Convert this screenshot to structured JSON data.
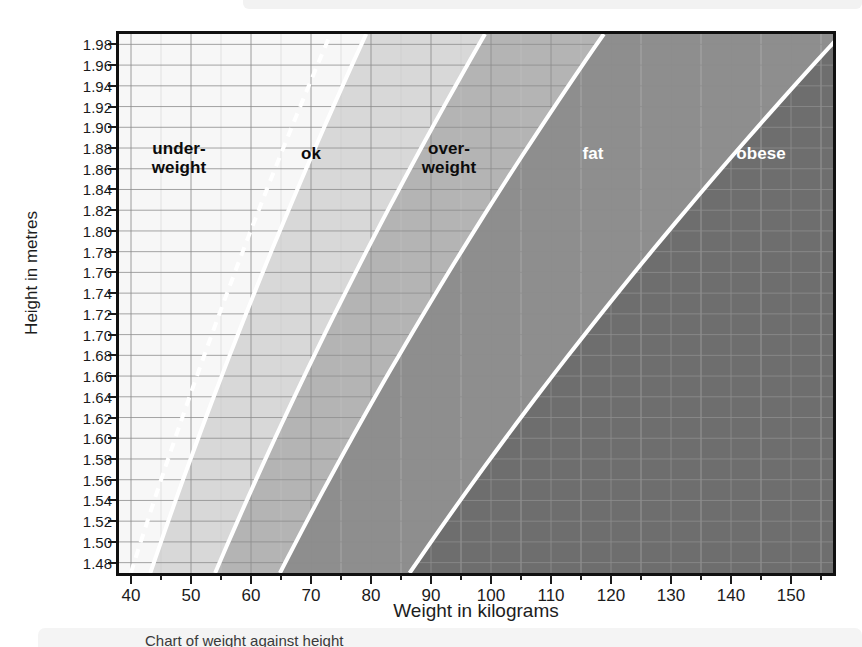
{
  "figure": {
    "y_axis_title": "Height in metres",
    "x_axis_title": "Weight in kilograms",
    "caption": "Chart of weight against height"
  },
  "chart_data": {
    "type": "area",
    "title": "",
    "subtitle": "",
    "xlabel": "Weight in kilograms",
    "ylabel": "Height in metres",
    "xlim": [
      38,
      157
    ],
    "ylim": [
      1.47,
      1.99
    ],
    "grid": true,
    "legend_position": "inline-labels",
    "x_major_ticks": [
      40,
      50,
      60,
      70,
      80,
      90,
      100,
      110,
      120,
      130,
      140,
      150
    ],
    "x_minor_step": 5,
    "y_ticks": [
      1.98,
      1.96,
      1.94,
      1.92,
      1.9,
      1.88,
      1.86,
      1.84,
      1.82,
      1.8,
      1.78,
      1.76,
      1.74,
      1.72,
      1.7,
      1.68,
      1.66,
      1.64,
      1.62,
      1.6,
      1.58,
      1.56,
      1.54,
      1.52,
      1.5,
      1.48
    ],
    "y_tick_labels": [
      "1.98",
      "1.96",
      "1.94",
      "1.92",
      "1.90",
      "1.88",
      "1.86",
      "1.84",
      "1.82",
      "1.80",
      "1.78",
      "1.76",
      "1.74",
      "1.72",
      "1.70",
      "1.68",
      "1.66",
      "1.64",
      "1.62",
      "1.60",
      "1.58",
      "1.56",
      "1.54",
      "1.52",
      "1.50",
      "1.48"
    ],
    "boundary_bmi": [
      18.5,
      20,
      25,
      30,
      40
    ],
    "bands": [
      {
        "name": "underweight",
        "label": "under-\nweight",
        "bmi_min": 0,
        "bmi_max": 20,
        "fill": "#f7f7f7",
        "label_color": "#0c0c0c",
        "label_x_kg": 48,
        "label_y_m": 1.87
      },
      {
        "name": "ok",
        "label": "ok",
        "bmi_min": 20,
        "bmi_max": 25,
        "fill": "#d8d8d8",
        "label_color": "#0c0c0c",
        "label_x_kg": 70,
        "label_y_m": 1.875
      },
      {
        "name": "overweight",
        "label": "over-\nweight",
        "bmi_min": 25,
        "bmi_max": 30,
        "fill": "#b4b4b4",
        "label_color": "#0c0c0c",
        "label_x_kg": 93,
        "label_y_m": 1.87
      },
      {
        "name": "fat",
        "label": "fat",
        "bmi_min": 30,
        "bmi_max": 40,
        "fill": "#8e8e8e",
        "label_color": "#ffffff",
        "label_x_kg": 117,
        "label_y_m": 1.875
      },
      {
        "name": "obese",
        "label": "obese",
        "bmi_min": 40,
        "bmi_max": 999,
        "fill": "#6e6e6e",
        "label_color": "#ffffff",
        "label_x_kg": 145,
        "label_y_m": 1.875
      }
    ],
    "boundary_lines": [
      {
        "bmi": 18.5,
        "style": "dashed",
        "color": "#ffffff"
      },
      {
        "bmi": 20,
        "style": "solid",
        "color": "#ffffff"
      },
      {
        "bmi": 25,
        "style": "solid",
        "color": "#ffffff"
      },
      {
        "bmi": 30,
        "style": "solid",
        "color": "#ffffff"
      },
      {
        "bmi": 40,
        "style": "solid",
        "color": "#ffffff"
      }
    ],
    "colors": {
      "frame": "#101010",
      "gridline_major": "#8d8d8d",
      "gridline_minor": "#c8c8c8",
      "text": "#1b1b1b",
      "page_background": "#ffffff"
    }
  }
}
